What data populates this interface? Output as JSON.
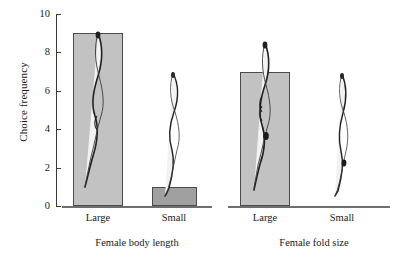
{
  "chart_data": {
    "type": "bar",
    "title": "",
    "xlabel": "",
    "ylabel": "Choice frequency",
    "ylim": [
      0,
      10
    ],
    "yticks": [
      0,
      2,
      4,
      6,
      8,
      10
    ],
    "ytick_labels": [
      "0",
      "2",
      "4",
      "6",
      "8",
      "10"
    ],
    "grid": false,
    "legend": "none",
    "panels": [
      {
        "label": "Female body length",
        "categories": [
          "Large",
          "Small"
        ],
        "values": [
          9,
          1
        ]
      },
      {
        "label": "Female fold size",
        "categories": [
          "Large",
          "Small"
        ],
        "values": [
          7,
          0
        ]
      }
    ],
    "annotations": [
      "worm illustration above Large bar, Female body length",
      "worm illustration above Small bar, Female body length",
      "worm illustration above Large bar, Female fold size",
      "worm illustration above Small bar, Female fold size"
    ],
    "colors": {
      "bar_large": "#c2c2c2",
      "bar_small": "#a0a0a2",
      "bar_border": "#4a4a4a",
      "axis": "#3a3a3a",
      "baseline": "#6e6e6e",
      "text": "#1a1a1a"
    }
  }
}
